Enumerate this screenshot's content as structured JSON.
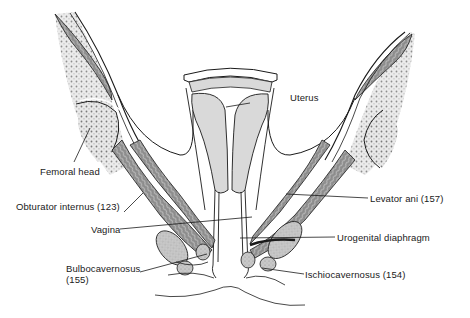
{
  "figure": {
    "colors": {
      "outline": "#1a1a1a",
      "organ_fill": "#d9d9d9",
      "muscle_fill": "#9a9a9a",
      "bone_fill": "#e6e6e6",
      "bone_stipple": "#7a7a7a",
      "background": "#ffffff"
    },
    "labels": [
      {
        "id": "femoral-head",
        "text": "Femoral head"
      },
      {
        "id": "obturator-internus",
        "text": "Obturator internus (123)"
      },
      {
        "id": "vagina",
        "text": "Vagina"
      },
      {
        "id": "bulbocavernosus",
        "text": "Bulbocavernosus\n(155)"
      },
      {
        "id": "uterus",
        "text": "Uterus"
      },
      {
        "id": "levator-ani",
        "text": "Levator ani (157)"
      },
      {
        "id": "urogenital-diaphragm",
        "text": "Urogenital diaphragm"
      },
      {
        "id": "ischiocavernosus",
        "text": "Ischiocavernosus (154)"
      }
    ]
  }
}
